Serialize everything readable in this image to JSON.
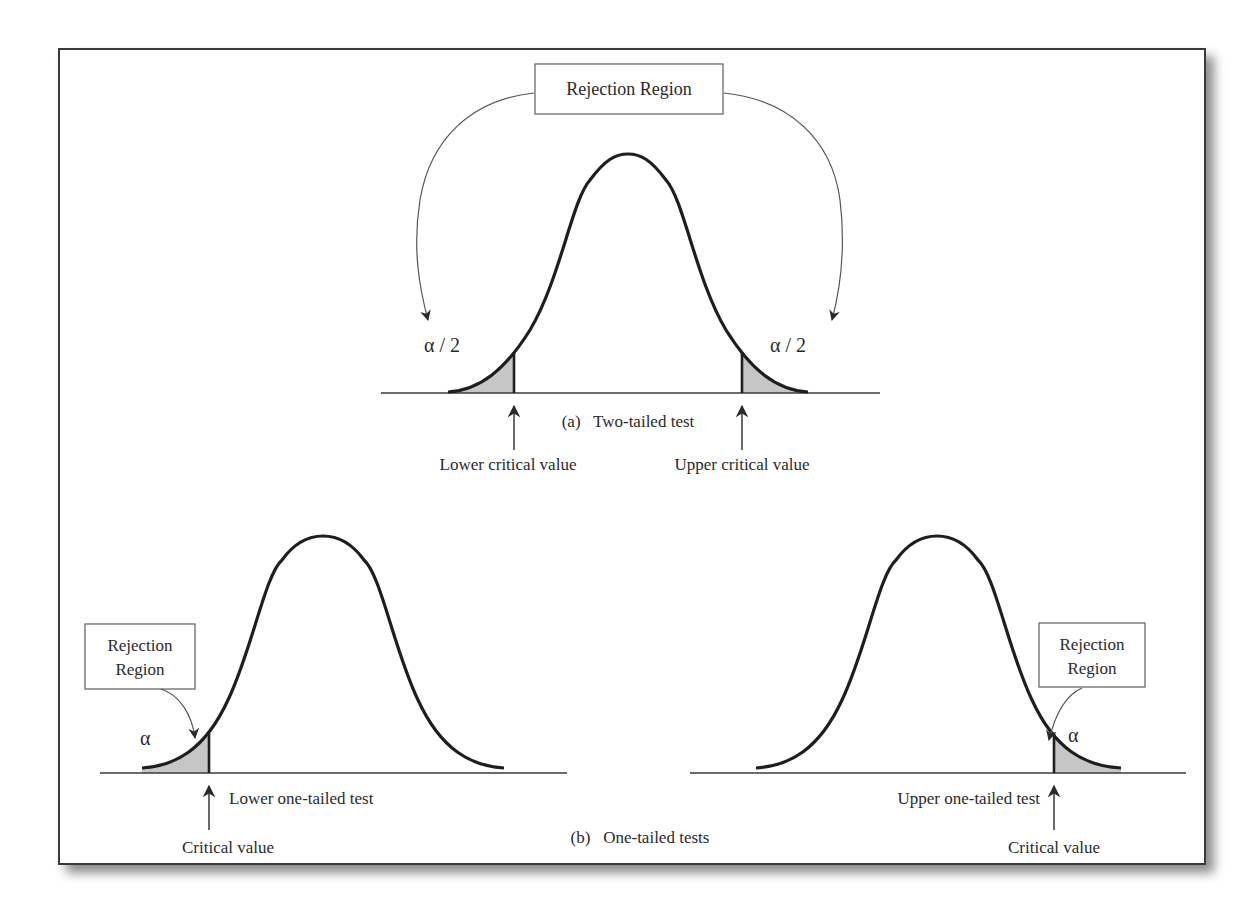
{
  "figure": {
    "top": {
      "rejection_box_label": "Rejection Region",
      "left_tail_label": "α / 2",
      "right_tail_label": "α / 2",
      "caption": "(a)   Two-tailed test",
      "lower_critical_label": "Lower critical value",
      "upper_critical_label": "Upper critical value"
    },
    "bottom_left": {
      "rejection_box_line1": "Rejection",
      "rejection_box_line2": "Region",
      "tail_label": "α",
      "test_label": "Lower one-tailed test",
      "critical_label": "Critical value"
    },
    "bottom_right": {
      "rejection_box_line1": "Rejection",
      "rejection_box_line2": "Region",
      "tail_label": "α",
      "test_label": "Upper one-tailed test",
      "critical_label": "Critical value"
    },
    "bottom_caption": "(b)   One-tailed tests",
    "colors": {
      "curve": "#1e1e1e",
      "shaded_region": "#c6c6c6",
      "frame": "#3a3a3a"
    }
  }
}
